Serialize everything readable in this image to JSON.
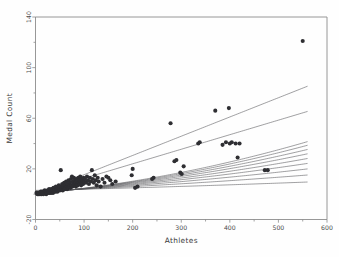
{
  "chart_data": {
    "type": "scatter",
    "title": "",
    "xlabel": "Athletes",
    "ylabel": "Medal Count",
    "xlim": [
      0,
      600
    ],
    "ylim": [
      -20,
      140
    ],
    "xticks": [
      0,
      100,
      200,
      300,
      400,
      500,
      600
    ],
    "yticks": [
      -20,
      20,
      60,
      100,
      140
    ],
    "xtick_labels": [
      "0",
      "100",
      "200",
      "300",
      "400",
      "500",
      "600"
    ],
    "ytick_labels": [
      "-20",
      "20",
      "60",
      "100",
      "140"
    ],
    "grid": false,
    "legend": null,
    "marker": "filled-circle",
    "marker_color": "#2e2e32",
    "curve_color": "#58585c",
    "points": [
      [
        2,
        1
      ],
      [
        3,
        1
      ],
      [
        4,
        0
      ],
      [
        5,
        1
      ],
      [
        6,
        0
      ],
      [
        7,
        1
      ],
      [
        8,
        1
      ],
      [
        9,
        0
      ],
      [
        10,
        1
      ],
      [
        11,
        2
      ],
      [
        12,
        0
      ],
      [
        13,
        1
      ],
      [
        14,
        2
      ],
      [
        15,
        1
      ],
      [
        16,
        0
      ],
      [
        17,
        2
      ],
      [
        18,
        1
      ],
      [
        19,
        3
      ],
      [
        20,
        1
      ],
      [
        21,
        2
      ],
      [
        22,
        0
      ],
      [
        23,
        2
      ],
      [
        24,
        1
      ],
      [
        25,
        3
      ],
      [
        26,
        1
      ],
      [
        27,
        2
      ],
      [
        28,
        4
      ],
      [
        29,
        1
      ],
      [
        30,
        2
      ],
      [
        31,
        3
      ],
      [
        32,
        1
      ],
      [
        33,
        4
      ],
      [
        34,
        2
      ],
      [
        35,
        3
      ],
      [
        36,
        1
      ],
      [
        37,
        5
      ],
      [
        38,
        2
      ],
      [
        39,
        3
      ],
      [
        40,
        4
      ],
      [
        41,
        2
      ],
      [
        42,
        6
      ],
      [
        43,
        3
      ],
      [
        44,
        4
      ],
      [
        45,
        2
      ],
      [
        46,
        5
      ],
      [
        47,
        3
      ],
      [
        48,
        7
      ],
      [
        49,
        4
      ],
      [
        50,
        3
      ],
      [
        51,
        6
      ],
      [
        52,
        19
      ],
      [
        53,
        5
      ],
      [
        54,
        4
      ],
      [
        55,
        8
      ],
      [
        56,
        3
      ],
      [
        57,
        6
      ],
      [
        58,
        5
      ],
      [
        59,
        9
      ],
      [
        60,
        4
      ],
      [
        61,
        7
      ],
      [
        62,
        5
      ],
      [
        63,
        10
      ],
      [
        64,
        6
      ],
      [
        65,
        4
      ],
      [
        66,
        8
      ],
      [
        67,
        5
      ],
      [
        68,
        11
      ],
      [
        69,
        7
      ],
      [
        70,
        6
      ],
      [
        71,
        9
      ],
      [
        72,
        5
      ],
      [
        73,
        12
      ],
      [
        74,
        7
      ],
      [
        75,
        14
      ],
      [
        76,
        6
      ],
      [
        77,
        10
      ],
      [
        78,
        8
      ],
      [
        79,
        13
      ],
      [
        80,
        7
      ],
      [
        81,
        11
      ],
      [
        82,
        9
      ],
      [
        83,
        6
      ],
      [
        84,
        12
      ],
      [
        85,
        8
      ],
      [
        86,
        10
      ],
      [
        87,
        7
      ],
      [
        88,
        13
      ],
      [
        89,
        9
      ],
      [
        90,
        11
      ],
      [
        91,
        8
      ],
      [
        92,
        14
      ],
      [
        93,
        10
      ],
      [
        94,
        7
      ],
      [
        95,
        12
      ],
      [
        96,
        9
      ],
      [
        97,
        11
      ],
      [
        98,
        8
      ],
      [
        99,
        13
      ],
      [
        100,
        10
      ],
      [
        102,
        12
      ],
      [
        104,
        9
      ],
      [
        106,
        14
      ],
      [
        108,
        11
      ],
      [
        110,
        8
      ],
      [
        112,
        13
      ],
      [
        114,
        10
      ],
      [
        116,
        19
      ],
      [
        118,
        12
      ],
      [
        120,
        9
      ],
      [
        122,
        15
      ],
      [
        124,
        11
      ],
      [
        126,
        7
      ],
      [
        128,
        13
      ],
      [
        130,
        10
      ],
      [
        134,
        6
      ],
      [
        138,
        12
      ],
      [
        142,
        9
      ],
      [
        146,
        14
      ],
      [
        150,
        13
      ],
      [
        154,
        11
      ],
      [
        158,
        8
      ],
      [
        165,
        10
      ],
      [
        198,
        15
      ],
      [
        200,
        20
      ],
      [
        205,
        5
      ],
      [
        210,
        6
      ],
      [
        240,
        12
      ],
      [
        243,
        13
      ],
      [
        278,
        56
      ],
      [
        286,
        26
      ],
      [
        290,
        27
      ],
      [
        298,
        17
      ],
      [
        301,
        16
      ],
      [
        305,
        22
      ],
      [
        335,
        40
      ],
      [
        338,
        41
      ],
      [
        370,
        66
      ],
      [
        385,
        39
      ],
      [
        392,
        41
      ],
      [
        398,
        68
      ],
      [
        400,
        40
      ],
      [
        404,
        41
      ],
      [
        412,
        40
      ],
      [
        416,
        29
      ],
      [
        420,
        40
      ],
      [
        472,
        19
      ],
      [
        478,
        19
      ],
      [
        550,
        121
      ]
    ],
    "curves": [
      {
        "name": "fit-1",
        "a": 3.0,
        "b": 0.009,
        "c": 5e-06
      },
      {
        "name": "fit-2",
        "a": 2.4,
        "b": 0.0155,
        "c": 1.3e-05
      },
      {
        "name": "fit-3",
        "a": 1.9,
        "b": 0.0205,
        "c": 2.1e-05
      },
      {
        "name": "fit-4",
        "a": 1.5,
        "b": 0.0245,
        "c": 2.9e-05
      },
      {
        "name": "fit-5",
        "a": 1.2,
        "b": 0.0275,
        "c": 3.7e-05
      },
      {
        "name": "fit-6",
        "a": 1.0,
        "b": 0.03,
        "c": 4.5e-05
      },
      {
        "name": "fit-7",
        "a": 0.8,
        "b": 0.032,
        "c": 5.3e-05
      },
      {
        "name": "fit-8",
        "a": 0.6,
        "b": 0.0338,
        "c": 6.1e-05
      },
      {
        "name": "fit-9",
        "a": 0.5,
        "b": 0.0352,
        "c": 6.8e-05
      },
      {
        "name": "line-shallow",
        "a": 1.0,
        "b": 0.115,
        "c": 0.0
      },
      {
        "name": "line-mid",
        "a": 0.2,
        "b": 0.152,
        "c": 0.0
      }
    ]
  }
}
